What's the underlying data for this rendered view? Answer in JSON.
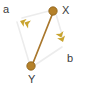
{
  "figure": {
    "type": "graph-diagram",
    "width": 85,
    "height": 86,
    "background": "#ffffff"
  },
  "colors": {
    "node_fill": "#b5812a",
    "node_stroke": "#8a5f18",
    "highlight_edge": "#a9772c",
    "plain_edge": "#ececec",
    "arrow": "#c8a32e",
    "label_text": "#3a3a3a"
  },
  "nodes": [
    {
      "id": "X",
      "label": "X",
      "cx": 53,
      "cy": 11,
      "r": 4.2,
      "label_x": 62,
      "label_y": 5
    },
    {
      "id": "Y",
      "label": "Y",
      "cx": 31,
      "cy": 66,
      "r": 4.2,
      "label_x": 28,
      "label_y": 74
    }
  ],
  "edges": [
    {
      "id": "x-to-a",
      "from": "X",
      "to": "a-arrow",
      "style": "plain",
      "x1": 49,
      "y1": 11,
      "x2": 22,
      "y2": 18
    },
    {
      "id": "a-to-y",
      "from": "a-arrow",
      "to": "Y",
      "style": "plain",
      "x1": 17,
      "y1": 22,
      "x2": 29,
      "y2": 62
    },
    {
      "id": "x-to-y",
      "from": "X",
      "to": "Y",
      "style": "highlight",
      "x1": 52,
      "y1": 15,
      "x2": 33,
      "y2": 63
    },
    {
      "id": "x-to-b",
      "from": "X",
      "to": "b-arrow",
      "style": "plain",
      "x1": 56,
      "y1": 14,
      "x2": 63,
      "y2": 38
    },
    {
      "id": "b-to-y",
      "from": "b-arrow",
      "to": "Y",
      "style": "plain",
      "x1": 62,
      "y1": 47,
      "x2": 35,
      "y2": 65
    }
  ],
  "arrow_markers": [
    {
      "id": "a-arrow",
      "label": "a",
      "x": 20,
      "y": 21,
      "angle": -160,
      "label_x": 3,
      "label_y": 4
    },
    {
      "id": "b-arrow",
      "label": "b",
      "x": 63,
      "y": 42,
      "angle": 70,
      "label_x": 67,
      "label_y": 53
    }
  ]
}
